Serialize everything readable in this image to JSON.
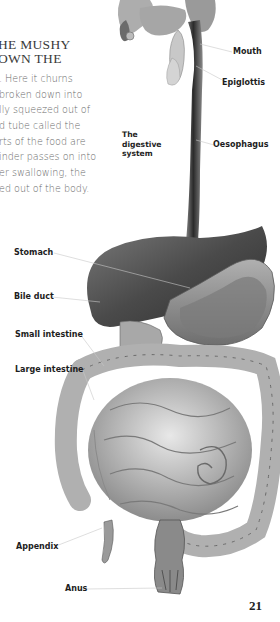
{
  "page": {
    "heading_lines": [
      "HE MUSHY",
      "OWN THE"
    ],
    "body_lines": [
      ". Here it churns",
      " broken down into",
      "lly squeezed out of",
      "d tube called the",
      "rts of the food are",
      "inder passes on into",
      "er swallowing, the",
      "ed out of the body."
    ],
    "page_number": "21"
  },
  "illustration": {
    "caption_lines": [
      "The",
      "digestive",
      "system"
    ],
    "labels": {
      "mouth": "Mouth",
      "epiglottis": "Epiglottis",
      "oesophagus": "Oesophagus",
      "stomach": "Stomach",
      "bile_duct": "Bile duct",
      "small_intestine": "Small intestine",
      "large_intestine": "Large intestine",
      "appendix": "Appendix",
      "anus": "Anus"
    },
    "colors": {
      "label_text": "#1d1d1d",
      "body_text": "#6a6a6a",
      "leader_line": "#c8c8c8"
    }
  }
}
